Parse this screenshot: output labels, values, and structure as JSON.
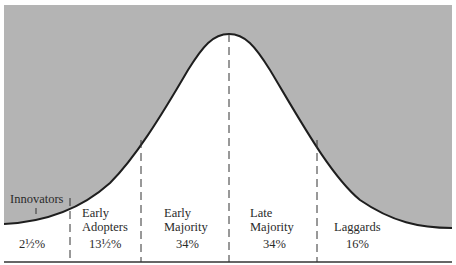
{
  "diagram": {
    "type": "bell-curve-adoption",
    "colors": {
      "shaded": "#b4b4b4",
      "curve": "#1e1e1e",
      "background": "#ffffff"
    },
    "segments": [
      {
        "name": "innovators",
        "label_line1": "Innovators",
        "label_line2": "",
        "percent": "2½%"
      },
      {
        "name": "early-adopters",
        "label_line1": "Early",
        "label_line2": "Adopters",
        "percent": "13½%"
      },
      {
        "name": "early-majority",
        "label_line1": "Early",
        "label_line2": "Majority",
        "percent": "34%"
      },
      {
        "name": "late-majority",
        "label_line1": "Late",
        "label_line2": "Majority",
        "percent": "34%"
      },
      {
        "name": "laggards",
        "label_line1": "Laggards",
        "label_line2": "",
        "percent": "16%"
      }
    ]
  }
}
